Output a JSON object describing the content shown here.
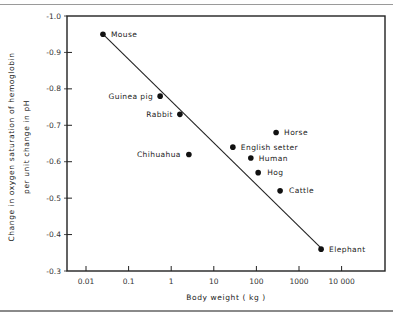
{
  "chart_data": {
    "type": "scatter",
    "title": "",
    "xlabel": "Body weight  ( kg )",
    "ylabel": "Change in oxygen saturation of hemoglobin per unit change in pH",
    "ylabel_lines": [
      "Change in oxygen saturation of hemoglobin",
      "per unit change in pH"
    ],
    "x_scale": "log",
    "xlim": [
      0.004,
      80000
    ],
    "ylim": [
      -0.3,
      -1.0
    ],
    "x_ticks": [
      0.01,
      0.1,
      1,
      10,
      100,
      1000,
      10000
    ],
    "x_tick_labels": [
      "0.01",
      "0.1",
      "1",
      "10",
      "100",
      "1000",
      "10 000"
    ],
    "y_ticks": [
      -1.0,
      -0.9,
      -0.8,
      -0.7,
      -0.6,
      -0.5,
      -0.4,
      -0.3
    ],
    "y_tick_labels": [
      "-1.0",
      "-0.9",
      "-0.8",
      "-0.7",
      "-0.6",
      "-0.5",
      "-0.4",
      "-0.3"
    ],
    "grid": false,
    "legend": null,
    "points": [
      {
        "label": "Mouse",
        "x": 0.025,
        "y": -0.95
      },
      {
        "label": "Guinea pig",
        "x": 0.55,
        "y": -0.78
      },
      {
        "label": "Rabbit",
        "x": 1.6,
        "y": -0.73
      },
      {
        "label": "Chihuahua",
        "x": 2.6,
        "y": -0.62
      },
      {
        "label": "English setter",
        "x": 28,
        "y": -0.64
      },
      {
        "label": "Horse",
        "x": 290,
        "y": -0.68
      },
      {
        "label": "Human",
        "x": 74,
        "y": -0.61
      },
      {
        "label": "Hog",
        "x": 110,
        "y": -0.57
      },
      {
        "label": "Cattle",
        "x": 360,
        "y": -0.52
      },
      {
        "label": "Elephant",
        "x": 3300,
        "y": -0.36
      }
    ],
    "fit_line": {
      "x": [
        0.025,
        3500
      ],
      "y": [
        -0.95,
        -0.36
      ]
    }
  }
}
